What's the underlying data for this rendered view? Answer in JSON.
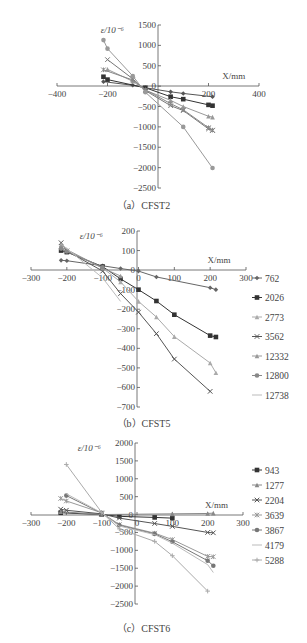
{
  "chart_data": [
    {
      "type": "line",
      "caption": "（a）CFST2",
      "ylabel": "ε/10⁻⁶",
      "xlabel": "X/mm",
      "xlim": [
        -400,
        400
      ],
      "ylim": [
        -2500,
        1500
      ],
      "xticks": [
        -400,
        -200,
        200,
        400
      ],
      "yticks": [
        1500,
        1000,
        500,
        0,
        -500,
        -1000,
        -1500,
        -2000,
        -2500
      ],
      "frame": {
        "top": 20,
        "x_axis_y": 86,
        "y_axis_x": 158,
        "x0px": 57,
        "x1px": 259,
        "y_top_px": 25,
        "y_bot_px": 188
      },
      "legend": [],
      "series": [
        {
          "name": "s1",
          "color": "#555555",
          "marker": "diamond",
          "x": [
            -216,
            -100,
            -50,
            50,
            100,
            216
          ],
          "y": [
            110,
            20,
            -40,
            -140,
            -180,
            -260
          ]
        },
        {
          "name": "s2",
          "color": "#333333",
          "marker": "square",
          "x": [
            -216,
            -200,
            -50,
            50,
            100,
            200,
            216
          ],
          "y": [
            230,
            160,
            -40,
            -260,
            -320,
            -460,
            -480
          ]
        },
        {
          "name": "s3",
          "color": "#999999",
          "marker": "triangle",
          "x": [
            -200,
            -100,
            -50,
            50,
            100,
            200,
            216
          ],
          "y": [
            410,
            120,
            -100,
            -350,
            -500,
            -740,
            -760
          ]
        },
        {
          "name": "s4",
          "color": "#777777",
          "marker": "x",
          "x": [
            -200,
            -100,
            -50,
            50,
            100,
            200,
            216
          ],
          "y": [
            650,
            180,
            -110,
            -480,
            -600,
            -1050,
            -1090
          ]
        },
        {
          "name": "s5",
          "color": "#888888",
          "marker": "star",
          "x": [
            -216,
            -100,
            -50,
            50,
            100,
            200,
            216
          ],
          "y": [
            400,
            150,
            -90,
            -430,
            -580,
            -1020,
            -1080
          ]
        },
        {
          "name": "s6",
          "color": "#999999",
          "marker": "circle",
          "x": [
            -216,
            -200,
            -100,
            -50,
            100,
            216
          ],
          "y": [
            1130,
            920,
            250,
            -150,
            -1000,
            -2010
          ]
        }
      ]
    },
    {
      "type": "line",
      "caption": "（b）CFST5",
      "ylabel": "ε/10⁻⁶",
      "xlabel": "X/mm",
      "xlim": [
        -300,
        300
      ],
      "ylim": [
        -700,
        200
      ],
      "xticks": [
        -300,
        -200,
        -100,
        0,
        100,
        200,
        300
      ],
      "yticks": [
        200,
        100,
        0,
        -100,
        -200,
        -300,
        -400,
        -500,
        -600,
        -700
      ],
      "frame": {
        "top": 225,
        "x_axis_y": 270,
        "y_axis_x": 137,
        "x0px": 31,
        "x1px": 246,
        "y_top_px": 231,
        "y_bot_px": 407
      },
      "legend": [
        "762",
        "2026",
        "2773",
        "3562",
        "12332",
        "12800",
        "12738"
      ],
      "series": [
        {
          "name": "762",
          "color": "#666666",
          "marker": "diamond",
          "x": [
            -216,
            -200,
            -100,
            -50,
            0,
            50,
            200,
            216
          ],
          "y": [
            50,
            48,
            22,
            8,
            -5,
            -35,
            -90,
            -100
          ]
        },
        {
          "name": "2026",
          "color": "#333333",
          "marker": "square",
          "x": [
            -216,
            -200,
            -100,
            -50,
            0,
            50,
            100,
            200,
            216
          ],
          "y": [
            100,
            92,
            18,
            -45,
            -100,
            -158,
            -228,
            -335,
            -342
          ]
        },
        {
          "name": "2773",
          "color": "#aaaaaa",
          "marker": "triangle",
          "x": [
            -216,
            -200,
            -100,
            -50,
            0,
            50,
            100,
            200,
            216
          ],
          "y": [
            120,
            100,
            10,
            -60,
            -160,
            -240,
            -340,
            -475,
            -525
          ]
        },
        {
          "name": "3562",
          "color": "#555555",
          "marker": "x",
          "x": [
            -216,
            -200,
            -100,
            -50,
            0,
            50,
            100,
            200
          ],
          "y": [
            140,
            98,
            -5,
            -120,
            -215,
            -325,
            -455,
            -620
          ]
        },
        {
          "name": "12332",
          "color": "#999999",
          "marker": "triangle",
          "x": [
            -216,
            -200,
            -100,
            -50
          ],
          "y": [
            130,
            105,
            10,
            -30
          ]
        },
        {
          "name": "12800",
          "color": "#888888",
          "marker": "circle",
          "x": [
            -216,
            -200,
            -100
          ],
          "y": [
            110,
            95,
            15
          ]
        },
        {
          "name": "12738",
          "color": "#bbbbbb",
          "marker": "none",
          "x": [
            -216,
            -200,
            -100,
            -50
          ],
          "y": [
            135,
            110,
            -40,
            -160
          ]
        }
      ]
    },
    {
      "type": "line",
      "caption": "（c）CFST6",
      "ylabel": "ε/10⁻⁶",
      "xlabel": "X/mm",
      "xlim": [
        -300,
        300
      ],
      "ylim": [
        -2500,
        2000
      ],
      "xticks": [
        -300,
        -200,
        -100,
        0,
        100,
        200,
        300
      ],
      "yticks": [
        2000,
        1500,
        1000,
        500,
        0,
        -500,
        -1000,
        -1500,
        -2000,
        -2500
      ],
      "frame": {
        "top": 437,
        "x_axis_y": 515,
        "y_axis_x": 135,
        "x0px": 31,
        "x1px": 243,
        "y_top_px": 443,
        "y_bot_px": 604
      },
      "legend": [
        "943",
        "1277",
        "2204",
        "3639",
        "3867",
        "4179",
        "5288"
      ],
      "series": [
        {
          "name": "943",
          "color": "#333333",
          "marker": "square",
          "x": [
            -216,
            -100,
            -50,
            50,
            100
          ],
          "y": [
            50,
            0,
            -50,
            -80,
            -100
          ]
        },
        {
          "name": "1277",
          "color": "#888888",
          "marker": "triangle",
          "x": [
            -216,
            -100,
            100,
            200,
            216
          ],
          "y": [
            80,
            0,
            20,
            30,
            40
          ]
        },
        {
          "name": "2204",
          "color": "#555555",
          "marker": "x",
          "x": [
            -216,
            -200,
            -100,
            -50,
            50,
            100,
            200,
            216
          ],
          "y": [
            150,
            120,
            20,
            -100,
            -250,
            -330,
            -500,
            -510
          ]
        },
        {
          "name": "3639",
          "color": "#999999",
          "marker": "star",
          "x": [
            -216,
            -200,
            -100,
            -50,
            50,
            100,
            200,
            216
          ],
          "y": [
            450,
            380,
            50,
            -280,
            -520,
            -700,
            -1170,
            -1180
          ]
        },
        {
          "name": "3867",
          "color": "#777777",
          "marker": "circle",
          "x": [
            -200,
            -100,
            -50,
            50,
            100,
            200,
            216
          ],
          "y": [
            530,
            40,
            -300,
            -540,
            -760,
            -1290,
            -1430
          ]
        },
        {
          "name": "4179",
          "color": "#bbbbbb",
          "marker": "none",
          "x": [
            -200,
            -100,
            -50,
            50,
            100,
            200,
            216
          ],
          "y": [
            580,
            50,
            -320,
            -560,
            -800,
            -1400,
            -1620
          ]
        },
        {
          "name": "5288",
          "color": "#aaaaaa",
          "marker": "plus",
          "x": [
            -200,
            -100,
            -50,
            50,
            100,
            200
          ],
          "y": [
            1400,
            60,
            -400,
            -750,
            -1150,
            -2140
          ]
        }
      ]
    }
  ]
}
